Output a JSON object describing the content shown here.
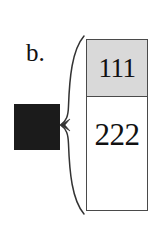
{
  "figure": {
    "panel_label": "b.",
    "background_color": "#ffffff",
    "glyph": {
      "name": "solid-black-square",
      "color": "#1b1b1b"
    },
    "brace": {
      "name": "left-curly-brace",
      "orientation": "opens-right",
      "stroke_color": "#333333"
    },
    "stack": {
      "border_color": "#4a4a4a",
      "cells": [
        {
          "value": "111",
          "fill_color": "#d9d9d9",
          "role": "top-cell"
        },
        {
          "value": "222",
          "fill_color": "#ffffff",
          "role": "bottom-cell"
        }
      ]
    }
  }
}
